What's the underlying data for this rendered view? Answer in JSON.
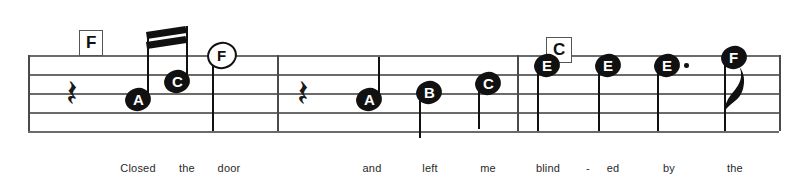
{
  "document": {
    "kind": "music-notation-excerpt",
    "staff_lines": 5,
    "clef_shown": false,
    "time_signature_shown": false
  },
  "colors": {
    "background": "#ffffff",
    "staff_line": "#6b6b6b",
    "ink": "#111111",
    "barline": "#4a4a4a",
    "lyric_text": "#2a2a2a",
    "chord_box_border": "#555555",
    "note_letter_on_filled": "#ffffff",
    "note_letter_on_hollow": "#111111"
  },
  "staff": {
    "left": 28,
    "right": 779,
    "top_line_y": 55,
    "line_spacing": 19,
    "line_ys": [
      55,
      74,
      93,
      112,
      131
    ]
  },
  "barlines": [
    {
      "name": "barline-1",
      "x": 277,
      "top": 55,
      "bottom": 131
    },
    {
      "name": "barline-2",
      "x": 517,
      "top": 55,
      "bottom": 131
    },
    {
      "name": "barline-end",
      "x": 779,
      "top": 55,
      "bottom": 131
    }
  ],
  "chords": [
    {
      "label": "F",
      "x": 79,
      "y": 30,
      "measure": 1
    },
    {
      "label": "C",
      "x": 546,
      "y": 37,
      "measure": 3
    }
  ],
  "measures": [
    {
      "index": 1,
      "rest": {
        "type": "quarter-rest",
        "x": 72,
        "y": 93
      },
      "notes": [
        {
          "letter": "A",
          "x": 138,
          "y": 99,
          "head": "filled",
          "stem": "up",
          "beamed": true,
          "duration": "sixteenth"
        },
        {
          "letter": "C",
          "x": 177,
          "y": 81,
          "head": "filled",
          "stem": "up",
          "beamed": true,
          "duration": "sixteenth"
        },
        {
          "letter": "F",
          "x": 222,
          "y": 55,
          "head": "hollow",
          "stem": "down",
          "beamed": false,
          "duration": "half"
        }
      ],
      "beam": {
        "x1": 146,
        "y1": 32,
        "x2": 186,
        "y2": 26,
        "count": 2
      }
    },
    {
      "index": 2,
      "rest": {
        "type": "quarter-rest",
        "x": 303,
        "y": 93
      },
      "notes": [
        {
          "letter": "A",
          "x": 369,
          "y": 99,
          "head": "filled",
          "stem": "up",
          "beamed": false,
          "duration": "quarter"
        },
        {
          "letter": "B",
          "x": 429,
          "y": 92,
          "head": "filled",
          "stem": "down",
          "beamed": false,
          "duration": "quarter"
        },
        {
          "letter": "C",
          "x": 488,
          "y": 83,
          "head": "filled",
          "stem": "down",
          "beamed": false,
          "duration": "quarter"
        }
      ],
      "beam": null
    },
    {
      "index": 3,
      "rest": null,
      "notes": [
        {
          "letter": "E",
          "x": 547,
          "y": 65,
          "head": "filled",
          "stem": "down",
          "beamed": false,
          "duration": "quarter"
        },
        {
          "letter": "E",
          "x": 608,
          "y": 65,
          "head": "filled",
          "stem": "down",
          "beamed": false,
          "duration": "quarter"
        },
        {
          "letter": "E",
          "x": 667,
          "y": 65,
          "head": "filled",
          "stem": "down",
          "beamed": false,
          "duration": "dotted-quarter",
          "dotted": true
        },
        {
          "letter": "F",
          "x": 734,
          "y": 57,
          "head": "filled",
          "stem": "down",
          "beamed": false,
          "duration": "eighth",
          "flag": true
        }
      ],
      "beam": null
    }
  ],
  "lyrics": [
    {
      "text": "Closed",
      "x": 138
    },
    {
      "text": "the",
      "x": 187
    },
    {
      "text": "door",
      "x": 229
    },
    {
      "text": "and",
      "x": 372
    },
    {
      "text": "left",
      "x": 430
    },
    {
      "text": "me",
      "x": 488
    },
    {
      "text": "blind",
      "x": 548
    },
    {
      "text": "-",
      "x": 588
    },
    {
      "text": "ed",
      "x": 613
    },
    {
      "text": "by",
      "x": 669
    },
    {
      "text": "the",
      "x": 735
    }
  ],
  "lyric_line_y": 162,
  "glyphs": {
    "quarter_rest": "𝄽"
  }
}
